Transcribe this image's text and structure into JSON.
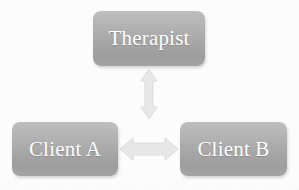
{
  "diagram": {
    "type": "relationship-triangle",
    "background_color": "#fcfcfc",
    "node_fill_color": "#b0b0b0",
    "node_text_color": "#ffffff",
    "connector_color": "#e9e9e9",
    "nodes": [
      {
        "id": "therapist",
        "label": "Therapist",
        "position": "top-center"
      },
      {
        "id": "client-a",
        "label": "Client A",
        "position": "bottom-left"
      },
      {
        "id": "client-b",
        "label": "Client B",
        "position": "bottom-right"
      }
    ],
    "connectors": [
      {
        "id": "therapist-clients",
        "icon": "double-arrow-vertical-icon",
        "orientation": "vertical",
        "from": "Therapist",
        "to": "Client A / Client B",
        "bidirectional": true
      },
      {
        "id": "client-a-client-b",
        "icon": "double-arrow-horizontal-icon",
        "orientation": "horizontal",
        "from": "Client A",
        "to": "Client B",
        "bidirectional": true
      }
    ]
  }
}
